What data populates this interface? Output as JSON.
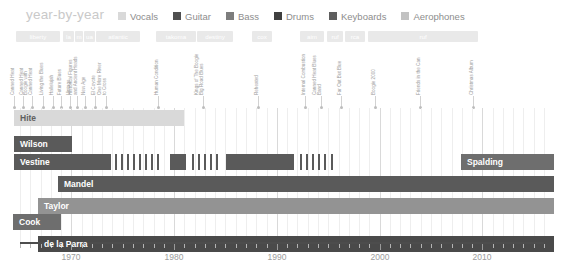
{
  "header": {
    "brand": "year-by-year",
    "legend": [
      {
        "label": "Vocals",
        "color": "#d9d9d9"
      },
      {
        "label": "Guitar",
        "color": "#4f4f4f"
      },
      {
        "label": "Bass",
        "color": "#7d7d7d"
      },
      {
        "label": "Drums",
        "color": "#3f3f3f"
      },
      {
        "label": "Keyboards",
        "color": "#5e5e5e"
      },
      {
        "label": "Aerophones",
        "color": "#c2c2c2"
      }
    ]
  },
  "labels_row": [
    {
      "name": "liberty",
      "x": 16,
      "w": 44
    },
    {
      "name": "la",
      "x": 63,
      "w": 11
    },
    {
      "name": "m",
      "x": 75,
      "w": 8
    },
    {
      "name": "ua",
      "x": 84,
      "w": 11
    },
    {
      "name": "atlantic",
      "x": 96,
      "w": 44
    },
    {
      "name": "takoma",
      "x": 156,
      "w": 40
    },
    {
      "name": "destiny",
      "x": 197,
      "w": 36
    },
    {
      "name": "cox",
      "x": 252,
      "w": 20
    },
    {
      "name": "aim",
      "x": 300,
      "w": 24
    },
    {
      "name": "ruf",
      "x": 327,
      "w": 16
    },
    {
      "name": "rca",
      "x": 345,
      "w": 20
    },
    {
      "name": "ruf",
      "x": 368,
      "w": 110
    }
  ],
  "albums": [
    {
      "x": 15,
      "lines": [
        "Canned Heat"
      ]
    },
    {
      "x": 24,
      "lines": [
        "Canned Heat"
      ]
    },
    {
      "x": 33,
      "lines": [
        "Boogie with",
        "Canned Heat"
      ]
    },
    {
      "x": 44,
      "lines": [
        "Living the Blues"
      ]
    },
    {
      "x": 54,
      "lines": [
        "Hallelujah"
      ]
    },
    {
      "x": 62,
      "lines": [
        "Future Blues"
      ]
    },
    {
      "x": 71,
      "lines": [
        "Vintage"
      ]
    },
    {
      "x": 78,
      "lines": [
        "Historical Figures",
        "and Ancient Heads"
      ]
    },
    {
      "x": 86,
      "lines": [
        "New Age"
      ]
    },
    {
      "x": 96,
      "lines": [
        "El Coyote"
      ]
    },
    {
      "x": 107,
      "lines": [
        "One More River",
        "to Cross"
      ]
    },
    {
      "x": 159,
      "lines": [
        "Human Condition"
      ]
    },
    {
      "x": 204,
      "lines": [
        "Kings of The Boogie",
        "Big Road Blues"
      ]
    },
    {
      "x": 259,
      "lines": [
        "Reheated"
      ]
    },
    {
      "x": 306,
      "lines": [
        "Internal Combustion"
      ]
    },
    {
      "x": 322,
      "lines": [
        "Canned Heat Blues",
        "Band"
      ]
    },
    {
      "x": 342,
      "lines": [
        "Far Out But Blue"
      ]
    },
    {
      "x": 376,
      "lines": [
        "Boogie 2000"
      ]
    },
    {
      "x": 421,
      "lines": [
        "Friends in the Can"
      ]
    },
    {
      "x": 474,
      "lines": [
        "Christmas Album"
      ]
    }
  ],
  "members": [
    {
      "name": "Hite",
      "color": "#d9d9d9",
      "label_style": "onlight",
      "segments": [
        {
          "x": 14,
          "w": 170
        }
      ]
    },
    {
      "name": "Wilson",
      "color": "#5a5a5a",
      "label_style": "dark",
      "segments": [
        {
          "x": 14,
          "w": 58
        }
      ]
    },
    {
      "name": "Vestine",
      "color": "#5a5a5a",
      "label_style": "dark",
      "segments": [
        {
          "x": 14,
          "w": 97
        },
        {
          "x": 115,
          "w": 2
        },
        {
          "x": 121,
          "w": 2
        },
        {
          "x": 127,
          "w": 2
        },
        {
          "x": 133,
          "w": 2
        },
        {
          "x": 139,
          "w": 2
        },
        {
          "x": 145,
          "w": 2
        },
        {
          "x": 151,
          "w": 2
        },
        {
          "x": 157,
          "w": 2
        },
        {
          "x": 170,
          "w": 16
        },
        {
          "x": 192,
          "w": 2
        },
        {
          "x": 198,
          "w": 2
        },
        {
          "x": 204,
          "w": 2
        },
        {
          "x": 210,
          "w": 2
        },
        {
          "x": 216,
          "w": 2
        },
        {
          "x": 226,
          "w": 68
        },
        {
          "x": 300,
          "w": 2
        },
        {
          "x": 306,
          "w": 2
        },
        {
          "x": 312,
          "w": 2
        },
        {
          "x": 318,
          "w": 2
        },
        {
          "x": 324,
          "w": 2
        },
        {
          "x": 331,
          "w": 2
        }
      ]
    },
    {
      "name": "Spalding",
      "color": "#6e6e6e",
      "label_style": "dark",
      "segments": [
        {
          "x": 461,
          "w": 93
        }
      ]
    },
    {
      "name": "Mandel",
      "color": "#5a5a5a",
      "label_style": "dark",
      "segments": [
        {
          "x": 58,
          "w": 496
        }
      ]
    },
    {
      "name": "Taylor",
      "color": "#939393",
      "label_style": "dark",
      "segments": [
        {
          "x": 38,
          "w": 516
        }
      ]
    },
    {
      "name": "Cook",
      "color": "#6e6e6e",
      "label_style": "dark",
      "segments": [
        {
          "x": 13,
          "w": 48
        }
      ]
    },
    {
      "name": "de la Parra",
      "color": "#4a4a4a",
      "label_style": "dark",
      "segments": [
        {
          "x": 38,
          "w": 516
        }
      ]
    }
  ],
  "axis": {
    "ticks": [
      "1970",
      "1980",
      "1990",
      "2000",
      "2010"
    ],
    "start_year": 1965,
    "end_year": 2016
  }
}
